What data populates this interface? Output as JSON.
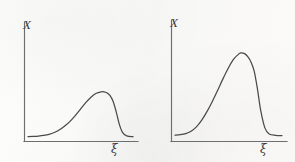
{
  "figure": {
    "background_color": "#fbfbfa",
    "ink_color": "#4a4a4c",
    "axis_color": "#6e6e70",
    "panel_count": 2
  },
  "chart_data": [
    {
      "type": "line",
      "title": "",
      "subtitle": "",
      "xlabel": "ξ",
      "ylabel": "X",
      "xlim": [
        0,
        1
      ],
      "ylim": [
        0,
        1
      ],
      "grid": false,
      "legend": "none",
      "annotations": [],
      "xticklabels": [],
      "yticklabels": [],
      "description": "Right-skewed unimodal curve: long gradual rise, broad rounded peak at about 70% of axis, then steep fall to a flat tail",
      "series": [
        {
          "name": "distribution-left",
          "x": [
            0.0,
            0.05,
            0.1,
            0.15,
            0.2,
            0.25,
            0.3,
            0.35,
            0.4,
            0.45,
            0.5,
            0.55,
            0.6,
            0.65,
            0.7,
            0.72,
            0.75,
            0.78,
            0.81,
            0.84,
            0.87,
            0.9,
            0.94,
            1.0
          ],
          "y": [
            0.035,
            0.037,
            0.042,
            0.052,
            0.068,
            0.095,
            0.135,
            0.19,
            0.26,
            0.345,
            0.44,
            0.535,
            0.615,
            0.672,
            0.695,
            0.694,
            0.68,
            0.64,
            0.555,
            0.4,
            0.215,
            0.098,
            0.045,
            0.035
          ]
        }
      ]
    },
    {
      "type": "line",
      "title": "",
      "subtitle": "",
      "xlabel": "ξ",
      "ylabel": "X",
      "xlim": [
        0,
        1
      ],
      "ylim": [
        0,
        1
      ],
      "grid": false,
      "legend": "none",
      "annotations": [],
      "xticklabels": [],
      "yticklabels": [],
      "description": "Right-skewed unimodal curve, taller and narrower than the left panel: steeper rise, sharp peak at about 62% of axis, near-vertical fall to a flat tail",
      "series": [
        {
          "name": "distribution-right",
          "x": [
            0.0,
            0.05,
            0.1,
            0.15,
            0.2,
            0.25,
            0.3,
            0.35,
            0.4,
            0.45,
            0.5,
            0.55,
            0.6,
            0.62,
            0.65,
            0.68,
            0.71,
            0.74,
            0.77,
            0.8,
            0.84,
            0.88,
            0.94,
            1.0
          ],
          "y": [
            0.04,
            0.044,
            0.055,
            0.08,
            0.125,
            0.195,
            0.285,
            0.39,
            0.505,
            0.625,
            0.735,
            0.825,
            0.88,
            0.888,
            0.88,
            0.85,
            0.795,
            0.7,
            0.52,
            0.3,
            0.115,
            0.052,
            0.038,
            0.036
          ]
        }
      ]
    }
  ],
  "panels": [
    {
      "id": "panel-left",
      "y_axis_label": "X",
      "x_axis_label": "ξ",
      "y_axis_name": "x-variable-axis",
      "x_axis_name": "xi-variable-axis"
    },
    {
      "id": "panel-right",
      "y_axis_label": "X",
      "x_axis_label": "ξ",
      "y_axis_name": "x-variable-axis",
      "x_axis_name": "xi-variable-axis"
    }
  ]
}
